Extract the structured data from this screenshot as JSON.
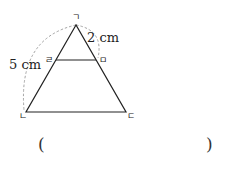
{
  "figure": {
    "type": "trapezoid-in-triangle",
    "vertices": {
      "apex": "ㄱ",
      "bottom_left": "ㄴ",
      "bottom_right": "ㄷ",
      "left_mid": "ㄹ",
      "right_mid": "ㅁ"
    },
    "measurements": {
      "left_arc": "5 cm",
      "right_arc": "2 cm"
    },
    "colors": {
      "line": "#222222",
      "dashed_arc": "#999999"
    }
  },
  "answer": {
    "open_paren": "(",
    "close_paren": ")",
    "value": ""
  }
}
